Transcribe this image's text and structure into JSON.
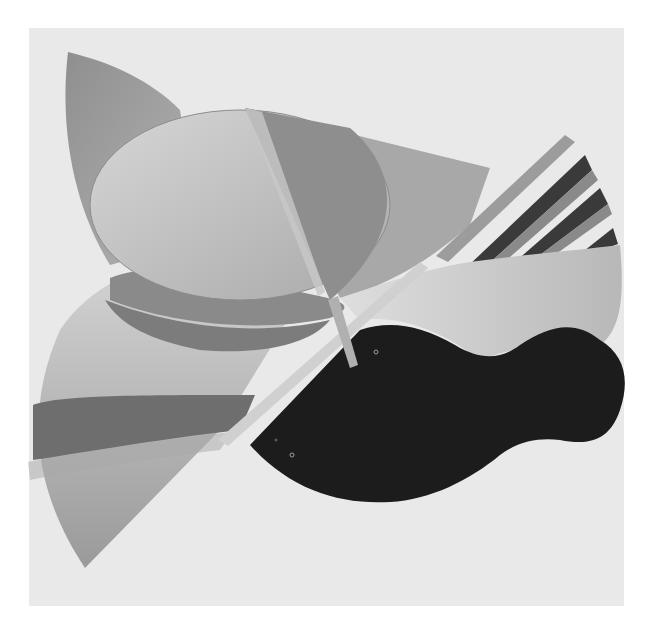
{
  "image": {
    "subject": "black-and-white photograph of an abstract geometric sculpture",
    "background_color": "#e9e9e9",
    "page_color": "#ffffff",
    "elements": [
      {
        "name": "top-left-leaf",
        "tone": "#9a9a9a"
      },
      {
        "name": "dome-disc",
        "tone": "#c4c4c4"
      },
      {
        "name": "triangular-fin",
        "tone": "#8e8e8e"
      },
      {
        "name": "right-flat-plate",
        "tone": "#a8a8a8"
      },
      {
        "name": "diagonal-stripes",
        "tones": [
          "#9c9c9c",
          "#3a3a3a",
          "#7a7a7a"
        ]
      },
      {
        "name": "wavy-light-panel",
        "tone": "#cfcfcf"
      },
      {
        "name": "black-blob",
        "tone": "#1c1c1c"
      },
      {
        "name": "lower-left-leaf",
        "tones": [
          "#d2d2d2",
          "#6e6e6e",
          "#a6a6a6"
        ]
      },
      {
        "name": "mid-band",
        "tone": "#8a8a8a"
      },
      {
        "name": "diagonal-rod",
        "tone": "#b0b0b0"
      }
    ]
  }
}
